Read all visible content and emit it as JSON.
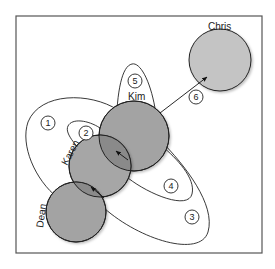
{
  "diagram": {
    "type": "relationship-circles",
    "colors": {
      "frame": "#555555",
      "circle_fill_dark": "#a3a3a3",
      "circle_fill_light": "#c4c4c4",
      "overlap_fill": "#8a8a8a",
      "stroke": "#222222",
      "background": "#ffffff"
    },
    "people": [
      {
        "id": "kim",
        "label": "Kim"
      },
      {
        "id": "karen",
        "label": "Karen"
      },
      {
        "id": "dean",
        "label": "Dean"
      },
      {
        "id": "chris",
        "label": "Chris"
      }
    ],
    "markers": [
      {
        "id": "1",
        "label": "1"
      },
      {
        "id": "2",
        "label": "2"
      },
      {
        "id": "3",
        "label": "3"
      },
      {
        "id": "4",
        "label": "4"
      },
      {
        "id": "5",
        "label": "5"
      },
      {
        "id": "6",
        "label": "6"
      }
    ]
  }
}
